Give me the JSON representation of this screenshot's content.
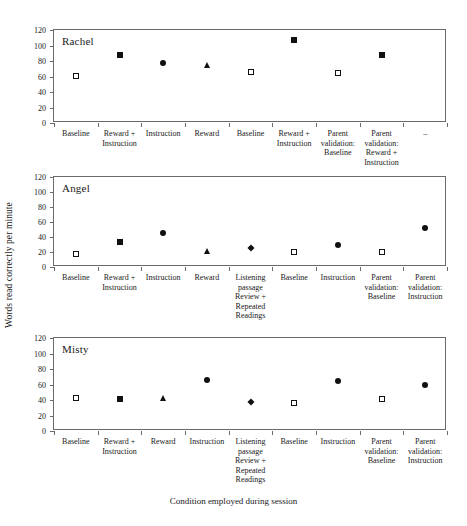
{
  "figure": {
    "ylabel": "Words read correctly per minute",
    "xlabel": "Condition employed during session",
    "yticks": [
      0,
      20,
      40,
      60,
      80,
      100,
      120
    ],
    "ylim": [
      0,
      120
    ],
    "marker_color": "#111111",
    "axis_color": "#6b6b6b"
  },
  "chart_data": {
    "type": "scatter",
    "title": "",
    "xlabel": "Condition employed during session",
    "ylabel": "Words read correctly per minute",
    "ylim": [
      0,
      120
    ],
    "yticks": [
      0,
      20,
      40,
      60,
      80,
      100,
      120
    ],
    "grid": false,
    "legend": "none",
    "panels": [
      {
        "name": "Rachel",
        "categories": [
          "Baseline",
          "Reward + Instruction",
          "Instruction",
          "Reward",
          "Baseline",
          "Reward + Instruction",
          "Parent validation: Baseline",
          "Parent validation: Reward + Instruction",
          "–"
        ],
        "values": [
          61,
          88,
          78,
          75,
          66,
          107,
          65,
          88,
          null
        ],
        "markers": [
          "square-open",
          "square-filled",
          "circle-filled",
          "triangle-filled",
          "square-open",
          "square-filled",
          "square-open",
          "square-filled",
          "none"
        ]
      },
      {
        "name": "Angel",
        "categories": [
          "Baseline",
          "Reward + Instruction",
          "Instruction",
          "Reward",
          "Listening passage Review + Repeated Readings",
          "Baseline",
          "Instruction",
          "Parent validation: Baseline",
          "Parent validation: Instruction"
        ],
        "values": [
          18,
          33,
          45,
          21,
          26,
          20,
          30,
          20,
          52
        ],
        "markers": [
          "square-open",
          "square-filled",
          "circle-filled",
          "triangle-filled",
          "diamond-filled",
          "square-open",
          "circle-filled",
          "square-open",
          "circle-filled"
        ]
      },
      {
        "name": "Misty",
        "categories": [
          "Baseline",
          "Reward + Instruction",
          "Reward",
          "Instruction",
          "Listening passage Review + Repeated Readings",
          "Baseline",
          "Instruction",
          "Parent validation: Baseline",
          "Parent validation: Instruction"
        ],
        "values": [
          43,
          41,
          42,
          66,
          37,
          36,
          64,
          41,
          60
        ],
        "markers": [
          "square-open",
          "square-filled",
          "triangle-filled",
          "circle-filled",
          "diamond-filled",
          "square-open",
          "circle-filled",
          "square-open",
          "circle-filled"
        ]
      }
    ]
  },
  "panel_labels": {
    "rachel": [
      "Baseline",
      "Reward +\nInstruction",
      "Instruction",
      "Reward",
      "Baseline",
      "Reward +\nInstruction",
      "Parent\nvalidation:\nBaseline",
      "Parent\nvalidation:\nReward +\nInstruction",
      "–"
    ],
    "angel": [
      "Baseline",
      "Reward +\nInstruction",
      "Instruction",
      "Reward",
      "Listening\npassage\nReview +\nRepeated\nReadings",
      "Baseline",
      "Instruction",
      "Parent\nvalidation:\nBaseline",
      "Parent\nvalidation:\nInstruction"
    ],
    "misty": [
      "Baseline",
      "Reward +\nInstruction",
      "Reward",
      "Instruction",
      "Listening\npassage\nReview +\nRepeated\nReadings",
      "Baseline",
      "Instruction",
      "Parent\nvalidation:\nBaseline",
      "Parent\nvalidation:\nInstruction"
    ]
  }
}
